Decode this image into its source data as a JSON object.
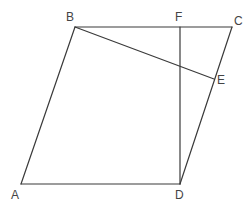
{
  "diagram": {
    "type": "geometry",
    "points": {
      "A": {
        "label": "A",
        "x": 21,
        "y": 184,
        "lx": 11,
        "ly": 199
      },
      "B": {
        "label": "B",
        "x": 75,
        "y": 27,
        "lx": 66,
        "ly": 21
      },
      "C": {
        "label": "C",
        "x": 232,
        "y": 27,
        "lx": 234,
        "ly": 25
      },
      "D": {
        "label": "D",
        "x": 180,
        "y": 184,
        "lx": 175,
        "ly": 199
      },
      "E": {
        "label": "E",
        "x": 214,
        "y": 79,
        "lx": 217,
        "ly": 84
      },
      "F": {
        "label": "F",
        "x": 180,
        "y": 27,
        "lx": 175,
        "ly": 21
      }
    },
    "segments": [
      {
        "from": "A",
        "to": "B"
      },
      {
        "from": "B",
        "to": "C"
      },
      {
        "from": "C",
        "to": "D"
      },
      {
        "from": "D",
        "to": "A"
      },
      {
        "from": "B",
        "to": "E"
      },
      {
        "from": "F",
        "to": "D"
      }
    ],
    "line_color": "#3a3a3a",
    "label_color": "#444444"
  }
}
